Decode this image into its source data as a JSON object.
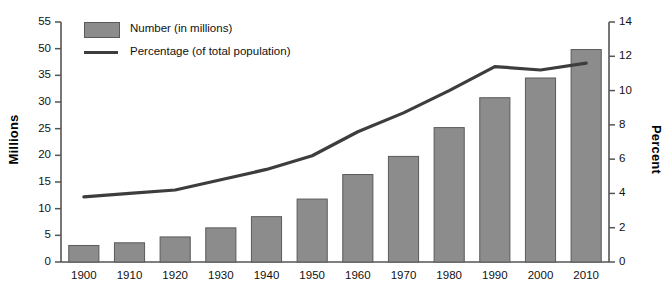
{
  "chart_data": {
    "type": "bar",
    "title": "",
    "subtitle": "",
    "xlabel": "",
    "ylabel": "Millions",
    "y2label": "Percent",
    "categories": [
      "1900",
      "1910",
      "1920",
      "1930",
      "1940",
      "1950",
      "1960",
      "1970",
      "1980",
      "1990",
      "2000",
      "2010"
    ],
    "ylim": [
      0,
      55
    ],
    "y2lim": [
      0,
      14
    ],
    "yticks": [
      "0",
      "5",
      "10",
      "15",
      "20",
      "25",
      "30",
      "35",
      "50",
      "55"
    ],
    "ytick_values": [
      0,
      5,
      10,
      15,
      20,
      25,
      30,
      35,
      50,
      55
    ],
    "y2ticks": [
      "0",
      "2",
      "4",
      "6",
      "8",
      "10",
      "12",
      "14"
    ],
    "y2tick_values": [
      0,
      2,
      4,
      6,
      8,
      10,
      12,
      14
    ],
    "grid": false,
    "legend_position": "top-left",
    "series": [
      {
        "name": "Number (in millions)",
        "type": "bar",
        "axis": "left",
        "color": "#8c8c8c",
        "edge_color": "#5a5a5a",
        "values": [
          3.1,
          3.6,
          4.7,
          6.4,
          8.5,
          11.8,
          16.4,
          19.8,
          25.2,
          30.8,
          34.5,
          49.5
        ]
      },
      {
        "name": "Percentage (of total population)",
        "type": "line",
        "axis": "right",
        "color": "#3d3d3d",
        "values": [
          3.8,
          4.0,
          4.2,
          4.8,
          5.4,
          6.2,
          7.6,
          8.7,
          10.0,
          11.4,
          11.2,
          11.6
        ]
      }
    ]
  },
  "legend": {
    "items": [
      {
        "label": "Number (in millions)",
        "marker": "swatch"
      },
      {
        "label": "Percentage (of total population)",
        "marker": "line"
      }
    ]
  },
  "axes": {
    "left_title": "Millions",
    "right_title": "Percent"
  }
}
